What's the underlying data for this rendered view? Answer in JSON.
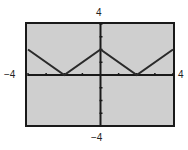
{
  "chart_data": {
    "type": "line",
    "title": "",
    "function": "y = ||x| - 2|",
    "xlim": [
      -4,
      4
    ],
    "ylim": [
      -4,
      4
    ],
    "xlabel": "",
    "ylabel": "",
    "grid": false,
    "x": [
      -4,
      -2,
      0,
      2,
      4
    ],
    "series": [
      {
        "name": "graph",
        "values": [
          2,
          0,
          2,
          0,
          2
        ]
      }
    ],
    "window_labels": {
      "xmin": "−4",
      "xmax": "4",
      "ymin": "−4",
      "ymax": "4"
    },
    "tick_spacing": 1,
    "colors": {
      "screen": "#cfcfcf",
      "line": "#2a2a2a",
      "frame": "#1a1a1a"
    }
  }
}
